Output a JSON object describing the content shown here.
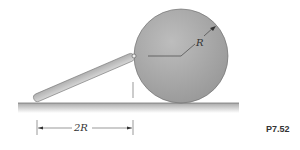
{
  "figure": {
    "id_label": "P7.52",
    "radius_label": "R",
    "distance_label": "2R"
  },
  "colors": {
    "disk": "#a8a8a8",
    "bar": "#c4c4c4",
    "ground": "#b5b5b5",
    "line": "#333333"
  }
}
